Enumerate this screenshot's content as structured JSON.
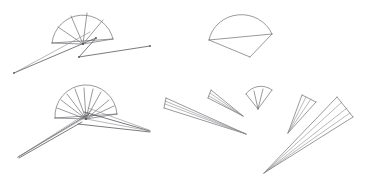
{
  "canvas": {
    "width": 366,
    "height": 181,
    "background_color": "#ffffff",
    "stroke_color": "#6e6e72",
    "stroke_color_light": "#8a8a8f",
    "stroke_color_dark": "#4f4f54",
    "stroke_width": 0.7,
    "content_type": "vector-line-sketch",
    "subject": "hand fan shapes at multiple scales, rotations and opening angles"
  },
  "shapes": [
    {
      "id": "fan-top-left-open",
      "name": "open-fan-with-crossing-ribs",
      "description": "Wide open fan, arc facing up, radial ribs converging at pivot below-center, with two long thin rib lines extending far down-left and down-right forming a shallow V",
      "pivot": {
        "x": 83,
        "y": 44
      },
      "radius": 31,
      "start_angle_deg": 182,
      "end_angle_deg": 352,
      "rib_count": 7,
      "has_long_ribs": true,
      "long_rib_endpoints": [
        {
          "x": 14,
          "y": 73
        },
        {
          "x": 150,
          "y": 46
        }
      ]
    },
    {
      "id": "fan-top-right-closed-dome",
      "name": "dome-fan-nearly-closed",
      "description": "Dome / half-ellipse arc with straight chord beneath it and a triangular tail pointing down-right; no visible ribs",
      "pivot": {
        "x": 241,
        "y": 36
      },
      "radius": 32,
      "start_angle_deg": 186,
      "end_angle_deg": 356,
      "rib_count": 0,
      "has_long_ribs": false,
      "tail_point": {
        "x": 250,
        "y": 57
      }
    },
    {
      "id": "fan-bottom-left-many-ribs",
      "name": "open-fan-many-ribs-with-twin-tails",
      "description": "Fan with many radial ribs, arc facing up, pivot low; two long narrow cone tails sweep down-left and down-right well past the fan body",
      "pivot": {
        "x": 86,
        "y": 119
      },
      "radius": 31,
      "start_angle_deg": 184,
      "end_angle_deg": 356,
      "rib_count": 13,
      "has_long_ribs": true,
      "long_rib_endpoints": [
        {
          "x": 18,
          "y": 157
        },
        {
          "x": 150,
          "y": 131
        }
      ]
    },
    {
      "id": "cone-bottom-mid-left",
      "name": "narrow-cone-pointing-down-right",
      "description": "Long slim cone, wide end upper-left, apex lower-right, with two inner rib lines",
      "apex": {
        "x": 246,
        "y": 134
      },
      "width_end_center": {
        "x": 170,
        "y": 103
      },
      "half_width": 6,
      "rib_count": 2
    },
    {
      "id": "cone-bottom-mid-small",
      "name": "small-narrow-cone-pointing-down-right",
      "description": "Small slim cone, wide end upper-left, apex lower-right, with two inner rib lines",
      "apex": {
        "x": 243,
        "y": 116
      },
      "width_end_center": {
        "x": 214,
        "y": 94
      },
      "half_width": 5,
      "rib_count": 2
    },
    {
      "id": "fan-bottom-mid-small-open",
      "name": "small-open-fan-wedge",
      "description": "Small open fan wedge, arc at top, apex at bottom, a few short ribs",
      "pivot": {
        "x": 258,
        "y": 109
      },
      "radius": 18,
      "start_angle_deg": 244,
      "end_angle_deg": 304,
      "rib_count": 3,
      "has_long_ribs": false
    },
    {
      "id": "cone-bottom-right-medium",
      "name": "medium-cone-pointing-down-left",
      "description": "Medium slim cone, wide end upper-right, apex lower-left, with two inner rib lines",
      "apex": {
        "x": 288,
        "y": 133
      },
      "width_end_center": {
        "x": 309,
        "y": 99
      },
      "half_width": 7,
      "rib_count": 2
    },
    {
      "id": "cone-bottom-right-large",
      "name": "large-cone-pointing-down-left",
      "description": "Largest slim cone, wide end upper-right near canvas edge, apex far lower-left, with three inner rib lines",
      "apex": {
        "x": 264,
        "y": 173
      },
      "width_end_center": {
        "x": 344,
        "y": 108
      },
      "half_width": 11,
      "rib_count": 3
    }
  ],
  "markers": [
    {
      "name": "pivot-dot-top-left-fan",
      "x": 83,
      "y": 44
    },
    {
      "name": "pivot-dot-bottom-left-fan",
      "x": 86,
      "y": 119
    },
    {
      "name": "rib-end-dot-top-left-a",
      "x": 150,
      "y": 46
    },
    {
      "name": "rib-end-dot-top-left-b",
      "x": 96,
      "y": 38
    }
  ]
}
